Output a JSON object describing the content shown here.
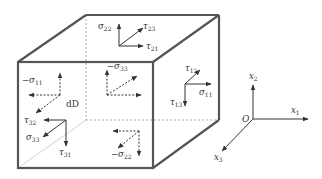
{
  "diagram": {
    "element_label": "dD",
    "colors": {
      "edge": "#555555",
      "hidden_edge": "#9a9a9a",
      "arrow": "#333333",
      "text": "#333333",
      "background": "#ffffff"
    },
    "faces": {
      "top": {
        "labels": [
          {
            "sym": "σ",
            "sub": "22"
          },
          {
            "sym": "τ",
            "sub": "23"
          },
          {
            "sym": "τ",
            "sub": "21"
          }
        ],
        "style": "solid"
      },
      "right": {
        "labels": [
          {
            "sym": "τ",
            "sub": "12"
          },
          {
            "sym": "σ",
            "sub": "11"
          },
          {
            "sym": "τ",
            "sub": "13"
          }
        ],
        "style": "solid"
      },
      "front": {
        "labels": [
          {
            "sym": "τ",
            "sub": "32"
          },
          {
            "sym": "σ",
            "sub": "33"
          },
          {
            "sym": "τ",
            "sub": "31"
          }
        ],
        "style": "solid"
      },
      "left_hidden": {
        "labels": [
          {
            "sym": "−σ",
            "sub": "11"
          }
        ],
        "style": "dashed"
      },
      "back_hidden": {
        "labels": [
          {
            "sym": "−σ",
            "sub": "33"
          }
        ],
        "style": "dashed"
      },
      "bottom_hidden": {
        "labels": [
          {
            "sym": "−σ",
            "sub": "22"
          }
        ],
        "style": "dashed"
      }
    },
    "axes": {
      "origin": "O",
      "x1": {
        "sym": "x",
        "sub": "1"
      },
      "x2": {
        "sym": "x",
        "sub": "2"
      },
      "x3": {
        "sym": "x",
        "sub": "3"
      }
    }
  }
}
